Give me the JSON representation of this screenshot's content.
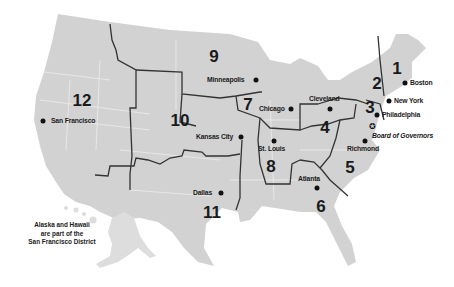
{
  "map": {
    "title": "Federal Reserve Districts",
    "colors": {
      "land": "#d2d2d2",
      "border": "#333333",
      "state_line": "#ececec",
      "text": "#1a1a1a"
    },
    "districts": [
      {
        "number": "1",
        "city": "Boston"
      },
      {
        "number": "2",
        "city": "New York"
      },
      {
        "number": "3",
        "city": "Philadelphia"
      },
      {
        "number": "4",
        "city": "Cleveland"
      },
      {
        "number": "5",
        "city": "Richmond"
      },
      {
        "number": "6",
        "city": "Atlanta"
      },
      {
        "number": "7",
        "city": "Chicago"
      },
      {
        "number": "8",
        "city": "St. Louis"
      },
      {
        "number": "9",
        "city": "Minneapolis"
      },
      {
        "number": "10",
        "city": "Kansas City"
      },
      {
        "number": "11",
        "city": "Dallas"
      },
      {
        "number": "12",
        "city": "San Francisco"
      }
    ],
    "board": {
      "label": "Board of Governors",
      "icon": "star-icon"
    },
    "note": {
      "line1": "Alaska and Hawaii",
      "line2": "are part of the",
      "line3": "San Francisco District"
    }
  }
}
